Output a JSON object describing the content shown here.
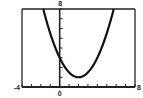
{
  "chart_data": {
    "type": "line",
    "title": "",
    "xlabel": "",
    "ylabel": "",
    "xlim": [
      -4,
      8
    ],
    "ylim": [
      0,
      8
    ],
    "grid": false,
    "legend": null,
    "x_tick_step": 1,
    "y_tick_step": 1,
    "axis_labels": {
      "x_min": "-4",
      "x_max": "8",
      "y_max": "8",
      "origin": "0"
    },
    "series": [
      {
        "name": "y = 0.5x^2 - 2x + 3",
        "x": [
          -1.74,
          -1,
          0,
          1,
          2,
          3,
          4,
          5,
          5.74
        ],
        "y": [
          8,
          5.5,
          3,
          1.5,
          1,
          1.5,
          3,
          5.5,
          8
        ]
      }
    ],
    "colors": {
      "curve": "#111111",
      "axes": "#222222"
    }
  }
}
